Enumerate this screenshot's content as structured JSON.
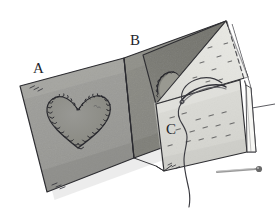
{
  "illustration": {
    "title": "Folded fabric pouch with appliqued heart, needle and pin",
    "subject": "sewing-craft-diagram",
    "background_color": "#ffffff",
    "line_color": "#2b2b30",
    "labels": [
      {
        "id": "A",
        "text": "A",
        "meaning": "outer-front-panel-with-heart",
        "x": 33,
        "y": 61
      },
      {
        "id": "B",
        "text": "B",
        "meaning": "outer-back-panel",
        "x": 130,
        "y": 33
      },
      {
        "id": "C",
        "text": "C",
        "meaning": "inner-lining-panel",
        "x": 166,
        "y": 122
      }
    ],
    "panels": [
      {
        "name": "left-panel",
        "label_ref": "A",
        "fill": "#9b9b97",
        "shade_fill": "#8e8e8a",
        "points": "20,86 124,58 134,158 47,192"
      },
      {
        "name": "middle-panel",
        "label_ref": "B",
        "fill": "#8a8a84",
        "shade_fill": "#7d7d78",
        "points": "124,58 226,21 238,120 134,158"
      },
      {
        "name": "inner-lining-panel",
        "label_ref": "C",
        "fill": "#d9d9d4",
        "points": "154,103 239,80 246,152 163,170"
      },
      {
        "name": "folded-flap-triangle",
        "fill": "#e6e6e1",
        "points": "226,21 247,76 156,104"
      },
      {
        "name": "flap-underside",
        "fill": "#77776f",
        "points": "226,21 156,104 146,58"
      }
    ],
    "heart": {
      "name": "applique-heart",
      "fill": "#8e8e8a",
      "stitch_style": "blanket-stitch",
      "stitch_count": 44,
      "center_x": 78,
      "center_y": 116,
      "width": 62,
      "height": 56
    },
    "partial_heart": {
      "name": "partial-heart-edge",
      "visible": true,
      "center_x": 168,
      "center_y": 76
    },
    "needle": {
      "name": "threaded-needle",
      "color": "#3a3a40",
      "tip_x": 182,
      "tip_y": 100,
      "eye_x": 222,
      "eye_y": 86
    },
    "thread": {
      "name": "trailing-thread",
      "color": "#3a3a40",
      "path": "wavy-s-curve"
    },
    "pin": {
      "name": "straight-pin",
      "shaft_color": "#8b8b8b",
      "head_color": "#5a5a5a",
      "x1": 218,
      "y1": 171,
      "x2": 259,
      "y2": 169,
      "head_radius": 3
    },
    "seam_lines": [
      {
        "name": "right-edge-dashed-seam",
        "style": "dashed"
      },
      {
        "name": "center-fold-line",
        "style": "solid"
      }
    ],
    "stitch_marks": {
      "name": "scattered-dash-stitches",
      "count": 22,
      "color": "#6a6a6a"
    },
    "corner_hatching": {
      "name": "corner-hatch-marks",
      "locations": [
        "top-left-panel",
        "bottom-left-panel",
        "bottom-right-panel"
      ]
    }
  }
}
